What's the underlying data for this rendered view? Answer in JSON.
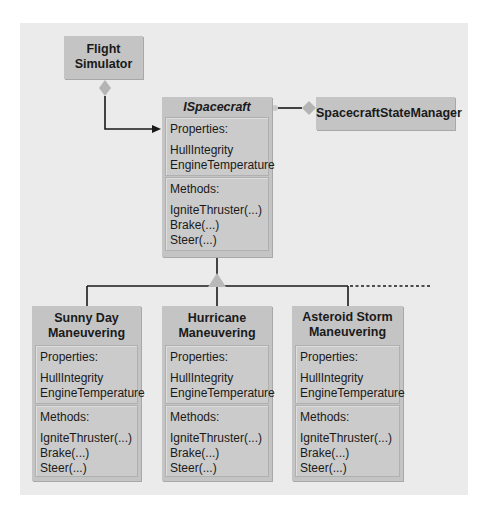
{
  "diagram": {
    "flight_simulator": {
      "title": [
        "Flight",
        "Simulator"
      ]
    },
    "interface": {
      "title": "ISpacecraft",
      "properties_label": "Properties:",
      "properties": [
        "HullIntegrity",
        "EngineTemperature"
      ],
      "methods_label": "Methods:",
      "methods": [
        "IgniteThruster(...)",
        "Brake(...)",
        "Steer(...)"
      ]
    },
    "state_manager": {
      "title": "SpacecraftStateManager"
    },
    "implementations": [
      {
        "title": [
          "Sunny Day",
          "Maneuvering"
        ],
        "properties_label": "Properties:",
        "properties": [
          "HullIntegrity",
          "EngineTemperature"
        ],
        "methods_label": "Methods:",
        "methods": [
          "IgniteThruster(...)",
          "Brake(...)",
          "Steer(...)"
        ]
      },
      {
        "title": [
          "Hurricane",
          "Maneuvering"
        ],
        "properties_label": "Properties:",
        "properties": [
          "HullIntegrity",
          "EngineTemperature"
        ],
        "methods_label": "Methods:",
        "methods": [
          "IgniteThruster(...)",
          "Brake(...)",
          "Steer(...)"
        ]
      },
      {
        "title": [
          "Asteroid Storm",
          "Maneuvering"
        ],
        "properties_label": "Properties:",
        "properties": [
          "HullIntegrity",
          "EngineTemperature"
        ],
        "methods_label": "Methods:",
        "methods": [
          "IgniteThruster(...)",
          "Brake(...)",
          "Steer(...)"
        ]
      }
    ],
    "colors": {
      "background": "#ebebeb",
      "box": "#c4c4c4",
      "line": "#1a1a1a"
    }
  }
}
